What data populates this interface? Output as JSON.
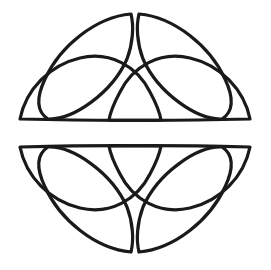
{
  "figure": {
    "background_color": "#ffffff",
    "stroke_color": "#1a1a1a",
    "stroke_width": 3.2,
    "canvas": {
      "width": 271,
      "height": 270
    },
    "center": {
      "x": 135,
      "y": 133
    },
    "bounds": {
      "left": 20,
      "top": 13,
      "right": 250,
      "bottom": 253
    },
    "symmetry": "bilateral vertical and horizontal mirror",
    "half_gap": {
      "top_half_ends_y": 122,
      "bottom_half_starts_y": 133
    }
  },
  "chart_data": {
    "type": "line",
    "xlabel": "",
    "ylabel": "",
    "xlim": [
      0,
      271
    ],
    "ylim": [
      0,
      270
    ],
    "grid": false,
    "legend": "none",
    "series": [
      {
        "name": "upper-left-diagonal-petal",
        "path": "M 131 14 C 96 17 60 46 45 79 C 36 98 37 112 48 119 C 73 120 112 93 127 59 C 133 43 134 26 131 14 Z"
      },
      {
        "name": "upper-right-diagonal-petal",
        "path": "M 139 14 C 174 17 210 46 225 79 C 234 98 233 112 222 119 C 197 120 158 93 143 59 C 137 43 136 26 139 14 Z"
      },
      {
        "name": "upper-left-horizontal-petal",
        "path": "M 20 119 C 26 89 50 65 80 58 C 110 51 137 66 150 92 C 157 105 160 114 161 120 C 110 121 61 120 20 119 Z"
      },
      {
        "name": "upper-right-horizontal-petal",
        "path": "M 250 119 C 244 89 220 65 190 58 C 160 51 133 66 120 92 C 113 105 110 114 109 120 C 160 121 209 120 250 119 Z"
      },
      {
        "name": "lower-left-diagonal-petal",
        "path": "M 131 252 C 96 249 60 220 45 187 C 36 168 37 154 48 147 C 73 146 112 173 127 207 C 133 223 134 240 131 252 Z"
      },
      {
        "name": "lower-right-diagonal-petal",
        "path": "M 139 252 C 174 249 210 220 225 187 C 234 168 233 154 222 147 C 197 146 158 173 143 207 C 137 223 136 240 139 252 Z"
      },
      {
        "name": "lower-left-horizontal-petal",
        "path": "M 20 147 C 26 177 50 201 80 208 C 110 215 137 200 150 174 C 157 161 160 152 161 146 C 110 145 61 146 20 147 Z"
      },
      {
        "name": "lower-right-horizontal-petal",
        "path": "M 250 147 C 244 177 220 201 190 208 C 160 215 133 200 120 174 C 113 161 110 152 109 146 C 160 145 209 146 250 147 Z"
      }
    ],
    "crossings": [
      {
        "x": 73,
        "y": 70
      },
      {
        "x": 197,
        "y": 70
      },
      {
        "x": 136,
        "y": 95
      },
      {
        "x": 73,
        "y": 196
      },
      {
        "x": 197,
        "y": 196
      },
      {
        "x": 136,
        "y": 171
      }
    ]
  }
}
